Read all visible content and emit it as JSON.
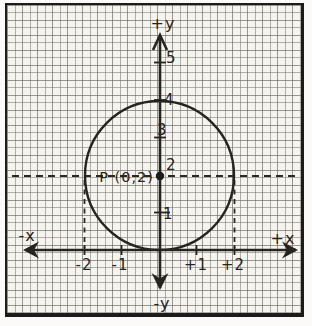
{
  "figure": {
    "axis_labels": {
      "pos_y": "+y",
      "neg_y": "-y",
      "pos_x": "+x",
      "neg_x": "-x"
    },
    "y_tick_labels": [
      "5",
      "4",
      "3",
      "2",
      "1"
    ],
    "x_tick_labels": [
      "-2",
      "-1",
      "+1",
      "+2"
    ],
    "point_label": "P (0,2)",
    "geometry": {
      "circle_center": [
        0,
        2
      ],
      "circle_radius": 2,
      "tangent_point": [
        0,
        0
      ],
      "dashed_horizontal_guide_y": 2,
      "dashed_vertical_guides_x": [
        -2,
        2
      ]
    },
    "colors": {
      "ink": "#26241f",
      "paper": "#f6f4ef",
      "grid": "#8d8880",
      "frame": "#1c1c1c"
    }
  }
}
